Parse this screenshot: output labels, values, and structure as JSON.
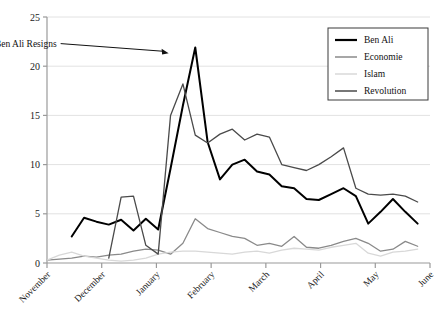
{
  "chart_data": {
    "type": "line",
    "title": "",
    "xlabel": "",
    "ylabel": "",
    "ylim": [
      0,
      25
    ],
    "yticks": [
      0,
      5,
      10,
      15,
      20,
      25
    ],
    "ytick_labels": [
      "0",
      "5",
      "10",
      "15",
      "20",
      "25"
    ],
    "grid": true,
    "grid_axis": "y",
    "legend_position": "top-right",
    "categories": [
      "November",
      "December",
      "January",
      "February",
      "March",
      "April",
      "May",
      "June"
    ],
    "xtick_labels": [
      "November",
      "December",
      "January",
      "February",
      "March",
      "April",
      "May",
      "June"
    ],
    "x_index_range": [
      0,
      31
    ],
    "series": [
      {
        "name": "Ben Ali",
        "color": "#000000",
        "width": 2.0,
        "x": [
          2,
          3,
          4,
          5,
          6,
          7,
          8,
          9,
          10,
          11,
          12,
          13,
          14,
          15,
          16,
          17,
          18,
          19,
          20,
          21,
          22,
          23,
          24,
          25,
          26,
          27,
          28,
          29,
          30
        ],
        "values": [
          2.7,
          4.6,
          4.2,
          3.9,
          4.4,
          3.3,
          4.5,
          3.4,
          9.6,
          16.0,
          21.9,
          12.3,
          8.5,
          10.0,
          10.5,
          9.3,
          9.0,
          7.8,
          7.6,
          6.5,
          6.4,
          7.0,
          7.6,
          6.8,
          4.0,
          5.2,
          6.5,
          5.2,
          4.0
        ]
      },
      {
        "name": "Economie",
        "color": "#8a8a8a",
        "width": 1.3,
        "x": [
          0,
          1,
          2,
          3,
          4,
          5,
          6,
          7,
          8,
          9,
          10,
          11,
          12,
          13,
          14,
          15,
          16,
          17,
          18,
          19,
          20,
          21,
          22,
          23,
          24,
          25,
          26,
          27,
          28,
          29,
          30
        ],
        "values": [
          0.3,
          0.4,
          0.5,
          0.7,
          0.6,
          0.8,
          0.9,
          1.2,
          1.4,
          1.3,
          0.9,
          2.0,
          4.5,
          3.5,
          3.1,
          2.7,
          2.5,
          1.8,
          2.0,
          1.7,
          2.7,
          1.6,
          1.5,
          1.8,
          2.2,
          2.5,
          2.0,
          1.2,
          1.4,
          2.2,
          1.7
        ]
      },
      {
        "name": "Islam",
        "color": "#d8d8d8",
        "width": 1.3,
        "x": [
          0,
          1,
          2,
          3,
          4,
          5,
          6,
          7,
          8,
          9,
          10,
          11,
          12,
          13,
          14,
          15,
          16,
          17,
          18,
          19,
          20,
          21,
          22,
          23,
          24,
          25,
          26,
          27,
          28,
          29,
          30
        ],
        "values": [
          0.3,
          0.8,
          1.1,
          0.7,
          0.5,
          0.3,
          0.2,
          0.3,
          0.5,
          0.9,
          1.1,
          1.2,
          1.2,
          1.1,
          1.0,
          0.9,
          1.1,
          1.2,
          1.0,
          1.3,
          1.5,
          1.4,
          1.3,
          1.6,
          1.8,
          2.0,
          1.0,
          0.7,
          1.1,
          1.2,
          1.4
        ]
      },
      {
        "name": "Revolution",
        "color": "#4a4a4a",
        "width": 1.3,
        "x": [
          5,
          6,
          7,
          8,
          9,
          10,
          11,
          12,
          13,
          14,
          15,
          16,
          17,
          18,
          19,
          20,
          21,
          22,
          23,
          24,
          25,
          26,
          27,
          28,
          29,
          30
        ],
        "values": [
          0.5,
          6.7,
          6.8,
          1.8,
          0.9,
          15.0,
          18.2,
          13.0,
          12.2,
          13.1,
          13.6,
          12.5,
          13.1,
          12.8,
          10.0,
          9.7,
          9.4,
          10.0,
          10.8,
          11.7,
          7.6,
          7.0,
          6.9,
          7.0,
          6.8,
          6.2
        ]
      }
    ],
    "annotations": [
      {
        "text": "Ben Ali Resigns",
        "arrow_from": [
          0.175,
          0.135
        ],
        "arrow_to": [
          0.385,
          0.165
        ]
      }
    ]
  },
  "axis": {
    "y_tick_0": "0",
    "y_tick_1": "5",
    "y_tick_2": "10",
    "y_tick_3": "15",
    "y_tick_4": "20",
    "y_tick_5": "25",
    "x_tick_0": "November",
    "x_tick_1": "December",
    "x_tick_2": "January",
    "x_tick_3": "February",
    "x_tick_4": "March",
    "x_tick_5": "April",
    "x_tick_6": "May",
    "x_tick_7": "June"
  },
  "legend": {
    "items": [
      {
        "label": "Ben Ali",
        "color": "#000000"
      },
      {
        "label": "Economie",
        "color": "#8a8a8a"
      },
      {
        "label": "Islam",
        "color": "#d8d8d8"
      },
      {
        "label": "Revolution",
        "color": "#4a4a4a"
      }
    ]
  },
  "annotation": {
    "resign_label": "Ben Ali Resigns"
  },
  "colors": {
    "ben_ali": "#000000",
    "economie": "#8a8a8a",
    "islam": "#d8d8d8",
    "revolution": "#4a4a4a",
    "grid": "#e2e2e2",
    "axis": "#9a9a9a",
    "text": "#141414"
  }
}
